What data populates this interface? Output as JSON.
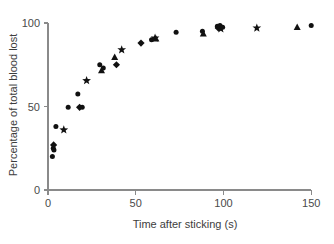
{
  "chart_data": {
    "type": "scatter",
    "title": "",
    "xlabel": "Time after sticking (s)",
    "ylabel": "Percentage of total blood lost",
    "xlim": [
      0,
      155
    ],
    "ylim": [
      0,
      103
    ],
    "xticks": [
      0,
      50,
      100,
      150
    ],
    "yticks": [
      0,
      50,
      100
    ],
    "xtick_labels": [
      "0",
      "50",
      "100",
      "150"
    ],
    "ytick_labels": [
      "0",
      "50",
      "100"
    ],
    "grid": false,
    "legend": "none",
    "axis_color": "#8a8a8a",
    "marker_color": "#111111",
    "marker_shapes": [
      "circle",
      "star",
      "diamond",
      "triangle"
    ],
    "points": [
      {
        "x": 2.5,
        "y": 20.0,
        "shape": "circle"
      },
      {
        "x": 3.0,
        "y": 25.0,
        "shape": "circle"
      },
      {
        "x": 3.2,
        "y": 27.0,
        "shape": "diamond"
      },
      {
        "x": 3.4,
        "y": 24.0,
        "shape": "circle"
      },
      {
        "x": 4.5,
        "y": 38.0,
        "shape": "circle"
      },
      {
        "x": 9.0,
        "y": 36.0,
        "shape": "star"
      },
      {
        "x": 11.5,
        "y": 49.5,
        "shape": "circle"
      },
      {
        "x": 17.0,
        "y": 57.5,
        "shape": "circle"
      },
      {
        "x": 18.0,
        "y": 49.5,
        "shape": "diamond"
      },
      {
        "x": 19.5,
        "y": 49.5,
        "shape": "circle"
      },
      {
        "x": 22.0,
        "y": 65.5,
        "shape": "star"
      },
      {
        "x": 29.5,
        "y": 75.0,
        "shape": "circle"
      },
      {
        "x": 30.5,
        "y": 71.5,
        "shape": "triangle"
      },
      {
        "x": 31.5,
        "y": 73.0,
        "shape": "circle"
      },
      {
        "x": 38.0,
        "y": 79.5,
        "shape": "triangle"
      },
      {
        "x": 39.0,
        "y": 75.0,
        "shape": "diamond"
      },
      {
        "x": 42.0,
        "y": 84.0,
        "shape": "star"
      },
      {
        "x": 53.0,
        "y": 88.0,
        "shape": "diamond"
      },
      {
        "x": 59.0,
        "y": 90.0,
        "shape": "circle"
      },
      {
        "x": 61.0,
        "y": 91.0,
        "shape": "star"
      },
      {
        "x": 61.5,
        "y": 90.5,
        "shape": "triangle"
      },
      {
        "x": 73.0,
        "y": 94.5,
        "shape": "circle"
      },
      {
        "x": 88.0,
        "y": 95.0,
        "shape": "circle"
      },
      {
        "x": 88.5,
        "y": 93.5,
        "shape": "triangle"
      },
      {
        "x": 96.5,
        "y": 98.0,
        "shape": "circle"
      },
      {
        "x": 97.0,
        "y": 97.0,
        "shape": "diamond"
      },
      {
        "x": 98.0,
        "y": 98.5,
        "shape": "circle"
      },
      {
        "x": 98.5,
        "y": 96.5,
        "shape": "star"
      },
      {
        "x": 99.5,
        "y": 97.5,
        "shape": "circle"
      },
      {
        "x": 119.0,
        "y": 97.0,
        "shape": "star"
      },
      {
        "x": 142.0,
        "y": 97.5,
        "shape": "triangle"
      },
      {
        "x": 150.0,
        "y": 98.5,
        "shape": "circle"
      }
    ]
  }
}
